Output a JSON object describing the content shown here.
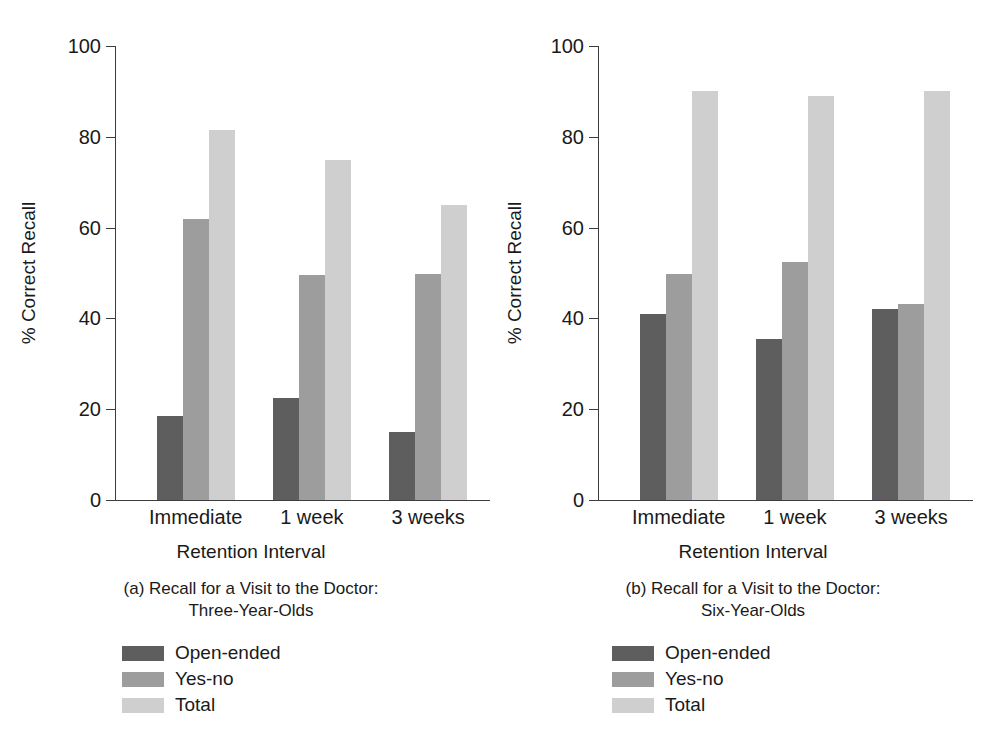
{
  "figure": {
    "series_colors": [
      "#5e5e5e",
      "#9d9d9d",
      "#cfcfcf"
    ]
  },
  "chart_data": [
    {
      "type": "bar",
      "panel": "a",
      "title": "(a) Recall for a Visit to the Doctor:",
      "subtitle": "Three-Year-Olds",
      "xlabel": "Retention Interval",
      "ylabel": "% Correct Recall",
      "categories": [
        "Immediate",
        "1 week",
        "3 weeks"
      ],
      "yticks": [
        0,
        20,
        40,
        60,
        80,
        100
      ],
      "ylim": [
        0,
        100
      ],
      "grid": false,
      "legend_position": "below-left",
      "series": [
        {
          "name": "Open-ended",
          "values": [
            18.4,
            22.5,
            15.0
          ]
        },
        {
          "name": "Yes-no",
          "values": [
            62.0,
            49.5,
            49.8
          ]
        },
        {
          "name": "Total",
          "values": [
            81.5,
            75.0,
            65.0
          ]
        }
      ]
    },
    {
      "type": "bar",
      "panel": "b",
      "title": "(b) Recall for a Visit to the Doctor:",
      "subtitle": "Six-Year-Olds",
      "xlabel": "Retention Interval",
      "ylabel": "% Correct Recall",
      "categories": [
        "Immediate",
        "1 week",
        "3 weeks"
      ],
      "yticks": [
        0,
        20,
        40,
        60,
        80,
        100
      ],
      "ylim": [
        0,
        100
      ],
      "grid": false,
      "legend_position": "below-left",
      "series": [
        {
          "name": "Open-ended",
          "values": [
            41.0,
            35.5,
            42.0
          ]
        },
        {
          "name": "Yes-no",
          "values": [
            49.7,
            52.5,
            43.2
          ]
        },
        {
          "name": "Total",
          "values": [
            90.0,
            89.0,
            90.0
          ]
        }
      ]
    }
  ]
}
